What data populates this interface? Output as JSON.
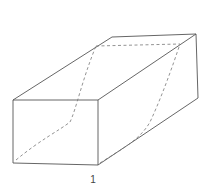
{
  "figure": {
    "label": "1",
    "colors": {
      "edge": "#555555",
      "hidden": "#777777",
      "background": "#ffffff"
    }
  }
}
